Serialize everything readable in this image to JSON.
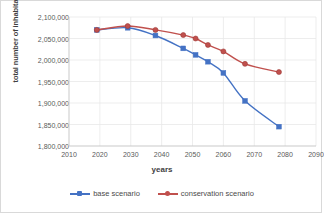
{
  "chart_data": {
    "type": "line",
    "title": "",
    "xlabel": "years",
    "ylabel": "total number of inhabitants",
    "xlim": [
      2010,
      2090
    ],
    "ylim": [
      1800000,
      2100000
    ],
    "xticks": [
      2010,
      2020,
      2030,
      2040,
      2050,
      2060,
      2070,
      2080,
      2090
    ],
    "yticks": [
      1800000,
      1850000,
      1900000,
      1950000,
      2000000,
      2050000,
      2100000
    ],
    "ytick_labels": [
      "1,800,000",
      "1,850,000",
      "1,900,000",
      "1,950,000",
      "2,000,000",
      "2,050,000",
      "2,100,000"
    ],
    "xtick_labels": [
      "2010",
      "2020",
      "2030",
      "2040",
      "2050",
      "2060",
      "2070",
      "2080",
      "2090"
    ],
    "grid": true,
    "legend_position": "bottom",
    "series": [
      {
        "name": "base scenario",
        "color": "#4472C4",
        "marker": "square",
        "x": [
          2019,
          2029,
          2038,
          2047,
          2051,
          2055,
          2060,
          2067,
          2078
        ],
        "values": [
          2070000,
          2075000,
          2057000,
          2027000,
          2012000,
          1996000,
          1970000,
          1905000,
          1845000
        ]
      },
      {
        "name": "conservation scenario",
        "color": "#C0504D",
        "marker": "circle",
        "x": [
          2019,
          2029,
          2038,
          2047,
          2051,
          2055,
          2060,
          2067,
          2078
        ],
        "values": [
          2070000,
          2079000,
          2070000,
          2058000,
          2050000,
          2035000,
          2020000,
          1991000,
          1972000
        ]
      }
    ]
  },
  "legend": {
    "items": [
      {
        "label": "base scenario",
        "color": "#4472C4"
      },
      {
        "label": "conservation scenario",
        "color": "#C0504D"
      }
    ]
  }
}
